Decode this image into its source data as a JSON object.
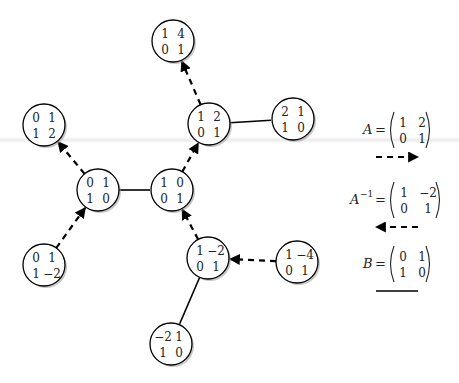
{
  "diagram": {
    "nodes": [
      {
        "id": "I",
        "matrix": [
          [
            "1",
            "0"
          ],
          [
            "0",
            "1"
          ]
        ]
      },
      {
        "id": "A",
        "matrix": [
          [
            "1",
            "2"
          ],
          [
            "0",
            "1"
          ]
        ]
      },
      {
        "id": "A2",
        "matrix": [
          [
            "1",
            "4"
          ],
          [
            "0",
            "1"
          ]
        ]
      },
      {
        "id": "AB",
        "matrix": [
          [
            "2",
            "1"
          ],
          [
            "1",
            "0"
          ]
        ]
      },
      {
        "id": "B",
        "matrix": [
          [
            "0",
            "1"
          ],
          [
            "1",
            "0"
          ]
        ]
      },
      {
        "id": "BA",
        "matrix": [
          [
            "0",
            "1"
          ],
          [
            "1",
            "2"
          ]
        ]
      },
      {
        "id": "BAi",
        "matrix": [
          [
            "0",
            "1"
          ],
          [
            "1",
            "−2"
          ]
        ]
      },
      {
        "id": "Ai",
        "matrix": [
          [
            "1",
            "−2"
          ],
          [
            "0",
            "1"
          ]
        ]
      },
      {
        "id": "Ai2",
        "matrix": [
          [
            "1",
            "−4"
          ],
          [
            "0",
            "1"
          ]
        ]
      },
      {
        "id": "AiB",
        "matrix": [
          [
            "−2",
            "1"
          ],
          [
            "1",
            "0"
          ]
        ]
      }
    ],
    "edges": [
      {
        "from": "I",
        "to": "A",
        "type": "A"
      },
      {
        "from": "A",
        "to": "A2",
        "type": "A"
      },
      {
        "from": "A",
        "to": "AB",
        "type": "B"
      },
      {
        "from": "B",
        "to": "I",
        "type": "B"
      },
      {
        "from": "B",
        "to": "BA",
        "type": "A"
      },
      {
        "from": "BAi",
        "to": "B",
        "type": "A"
      },
      {
        "from": "Ai",
        "to": "I",
        "type": "A"
      },
      {
        "from": "Ai2",
        "to": "Ai",
        "type": "A"
      },
      {
        "from": "Ai",
        "to": "AiB",
        "type": "B"
      }
    ]
  },
  "legend": {
    "items": [
      {
        "name": "A",
        "sup": "",
        "matrix": [
          [
            "1",
            "2"
          ],
          [
            "0",
            "1"
          ]
        ],
        "line": "dashed-right"
      },
      {
        "name": "A",
        "sup": "−1",
        "matrix": [
          [
            "1",
            "−2"
          ],
          [
            "0",
            "1"
          ]
        ],
        "line": "dashed-left"
      },
      {
        "name": "B",
        "sup": "",
        "matrix": [
          [
            "0",
            "1"
          ],
          [
            "1",
            "0"
          ]
        ],
        "line": "solid"
      }
    ],
    "equals": "="
  }
}
